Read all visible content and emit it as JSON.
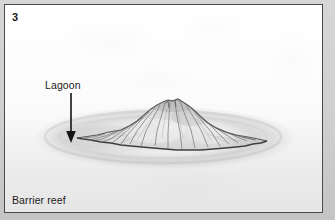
{
  "figure": {
    "stage_number": "3",
    "caption": "Barrier reef",
    "domain": "coral-reef-formation-diagram"
  },
  "annotations": [
    {
      "label": "Lagoon",
      "pointer": "down-arrow",
      "label_x": 40,
      "label_y": 74,
      "arrow_from_x": 66,
      "arrow_from_y": 90,
      "arrow_to_x": 66,
      "arrow_to_y": 136
    }
  ],
  "scene": {
    "island_name": "eroded volcanic island",
    "island_left_tip_x": 72,
    "island_right_tip_x": 262,
    "island_peak_x": 168,
    "island_peak_y": 96,
    "island_base_y": 142,
    "reef_ring_center_x": 160,
    "reef_ring_center_y": 133,
    "reef_ring_radius_x": 132,
    "reef_ring_radius_y": 31
  },
  "colors": {
    "panel_border": "#4a4a4a",
    "panel_background": "#ffffff",
    "page_background": "#cfcfcf",
    "ink": "#1b1b1b",
    "island_fill_light": "#efefef",
    "island_fill_mid": "#cfcfcf",
    "island_fill_dark": "#9d9d9d",
    "island_outline": "#4f4f4f",
    "reef_ring": "#d2d2d2",
    "lagoon_water": "#dedede"
  }
}
